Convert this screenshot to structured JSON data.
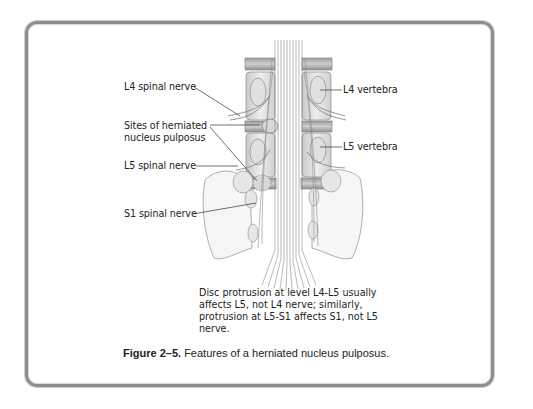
{
  "figure": {
    "number": "Figure 2–5.",
    "title": "Features of a herniated nucleus pulposus."
  },
  "labels": {
    "l4_spinal_nerve": "L4 spinal nerve",
    "sites_line1": "Sites of herniated",
    "sites_line2": "nucleus pulposus",
    "l5_spinal_nerve": "L5 spinal nerve",
    "s1_spinal_nerve": "S1 spinal nerve",
    "l4_vertebra": "L4 vertebra",
    "l5_vertebra": "L5 vertebra"
  },
  "note": "Disc protrusion at level L4-L5 usually affects L5, not L4 nerve; similarly, protrusion at L5-S1 affects S1, not L5 nerve.",
  "colors": {
    "frame": "#8e8e8e",
    "text": "#222222",
    "leader_line": "#333333"
  }
}
